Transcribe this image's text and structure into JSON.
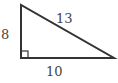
{
  "diagram": {
    "type": "right-triangle",
    "labels": {
      "left_side": "8",
      "hypotenuse": "13",
      "bottom_side": "10"
    },
    "right_angle_marker": true,
    "colors": {
      "stroke": "#333333",
      "label": "#444444",
      "background": "#ffffff"
    }
  }
}
